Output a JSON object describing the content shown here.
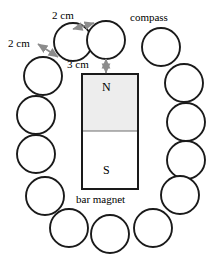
{
  "figure": {
    "panel_letter": "b)",
    "background_color": "#ffffff",
    "stroke_color": "#1a1a1a",
    "arrow_color": "#8c8c8c",
    "magnet_north_fill": "#ededed",
    "magnet_south_fill": "#ffffff",
    "width": 209,
    "height": 257
  },
  "labels": {
    "spacing_top": "2 cm",
    "spacing_left": "2 cm",
    "gap_to_magnet": "3 cm",
    "compass": "compass",
    "bar_magnet": "bar magnet",
    "north_pole": "N",
    "south_pole": "S"
  },
  "magnet": {
    "x": 82,
    "y": 74,
    "width": 56,
    "height": 115,
    "divider_y": 131
  },
  "compasses": [
    {
      "id": "c1",
      "cx": 73,
      "cy": 42,
      "r": 19
    },
    {
      "id": "c2",
      "cx": 106,
      "cy": 40,
      "r": 19
    },
    {
      "id": "c3",
      "cx": 161,
      "cy": 47,
      "r": 19
    },
    {
      "id": "c4",
      "cx": 43,
      "cy": 76,
      "r": 19
    },
    {
      "id": "c5",
      "cx": 184,
      "cy": 83,
      "r": 19
    },
    {
      "id": "c6",
      "cx": 36,
      "cy": 115,
      "r": 19
    },
    {
      "id": "c7",
      "cx": 186,
      "cy": 122,
      "r": 19
    },
    {
      "id": "c8",
      "cx": 36,
      "cy": 154,
      "r": 19
    },
    {
      "id": "c9",
      "cx": 186,
      "cy": 160,
      "r": 19
    },
    {
      "id": "c10",
      "cx": 45,
      "cy": 196,
      "r": 19
    },
    {
      "id": "c11",
      "cx": 180,
      "cy": 195,
      "r": 19
    },
    {
      "id": "c12",
      "cx": 69,
      "cy": 228,
      "r": 19
    },
    {
      "id": "c13",
      "cx": 110,
      "cy": 234,
      "r": 19
    },
    {
      "id": "c14",
      "cx": 153,
      "cy": 228,
      "r": 19
    }
  ],
  "arrows": [
    {
      "id": "arrow-top-2cm",
      "x1": 73,
      "y1": 29,
      "x2": 94,
      "y2": 23
    },
    {
      "id": "arrow-left-2cm",
      "x1": 58,
      "y1": 57,
      "x2": 38,
      "y2": 44
    },
    {
      "id": "arrow-3cm",
      "x1": 106,
      "y1": 59,
      "x2": 106,
      "y2": 73
    }
  ],
  "label_positions": {
    "panel_letter": {
      "x": 4,
      "y": 10
    },
    "spacing_top": {
      "x": 52,
      "y": 10
    },
    "spacing_left": {
      "x": 8,
      "y": 38
    },
    "gap_to_magnet": {
      "x": 67,
      "y": 59
    },
    "compass": {
      "x": 130,
      "y": 12
    },
    "bar_magnet": {
      "x": 76,
      "y": 194
    },
    "north_pole": {
      "x": 102,
      "y": 81
    },
    "south_pole": {
      "x": 103,
      "y": 164
    }
  }
}
